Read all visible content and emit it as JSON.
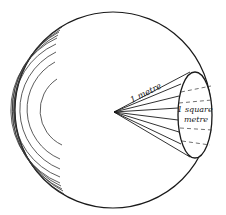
{
  "figure": {
    "labels": {
      "radius": "1 metre",
      "area_line1": "1 square",
      "area_line2": "metre"
    },
    "colors": {
      "ink": "#1a1a1a",
      "background": "#ffffff"
    },
    "geometry": {
      "sphere": {
        "cx": 113,
        "cy": 110,
        "r": 98
      },
      "apex": {
        "x": 114,
        "y": 112
      },
      "cone_base": {
        "cx": 195,
        "cy": 115,
        "rx": 17,
        "ry": 43
      }
    }
  }
}
